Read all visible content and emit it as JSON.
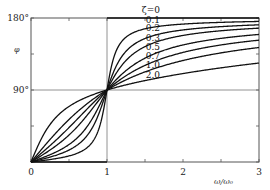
{
  "chart_data": {
    "type": "line",
    "title": "",
    "xlabel": "ω/ω₀",
    "ylabel": "φ",
    "xlim": [
      0,
      3
    ],
    "ylim": [
      0,
      180
    ],
    "x_ticks": [
      {
        "value": 0,
        "label": "0"
      },
      {
        "value": 0.5,
        "label": ""
      },
      {
        "value": 1,
        "label": "1"
      },
      {
        "value": 1.5,
        "label": ""
      },
      {
        "value": 2,
        "label": "2"
      },
      {
        "value": 2.5,
        "label": ""
      },
      {
        "value": 3,
        "label": "3"
      }
    ],
    "y_ticks": [
      {
        "value": 0,
        "label": ""
      },
      {
        "value": 45,
        "label": ""
      },
      {
        "value": 90,
        "label": "90°"
      },
      {
        "value": 135,
        "label": ""
      },
      {
        "value": 180,
        "label": "180°"
      }
    ],
    "gridlines": {
      "x": [
        1
      ],
      "y": [
        90
      ]
    },
    "legend_title": "ζ",
    "series": [
      {
        "name": "ζ=0",
        "zeta": 0,
        "label": "ζ=0"
      },
      {
        "name": "0.1",
        "zeta": 0.1,
        "label": "0.1"
      },
      {
        "name": "0.2",
        "zeta": 0.2,
        "label": "0.2"
      },
      {
        "name": "0.3",
        "zeta": 0.3,
        "label": "0.3"
      },
      {
        "name": "0.5",
        "zeta": 0.5,
        "label": "0.5"
      },
      {
        "name": "0.7",
        "zeta": 0.7,
        "label": "0.7"
      },
      {
        "name": "1.0",
        "zeta": 1.0,
        "label": "1.0"
      },
      {
        "name": "2.0",
        "zeta": 2.0,
        "label": "2.0"
      }
    ],
    "sample_values": {
      "x": [
        0,
        0.5,
        1,
        2,
        3
      ],
      "ζ=0.1": [
        0,
        7.6,
        90,
        172.4,
        177.1
      ],
      "ζ=0.5": [
        0,
        33.7,
        90,
        146.3,
        159.4
      ],
      "ζ=1.0": [
        0,
        53.1,
        90,
        126.9,
        143.1
      ],
      "ζ=2.0": [
        0,
        69.4,
        90,
        110.6,
        123.7
      ]
    },
    "legend_position": "inline-right-of-curves",
    "grid": false
  }
}
